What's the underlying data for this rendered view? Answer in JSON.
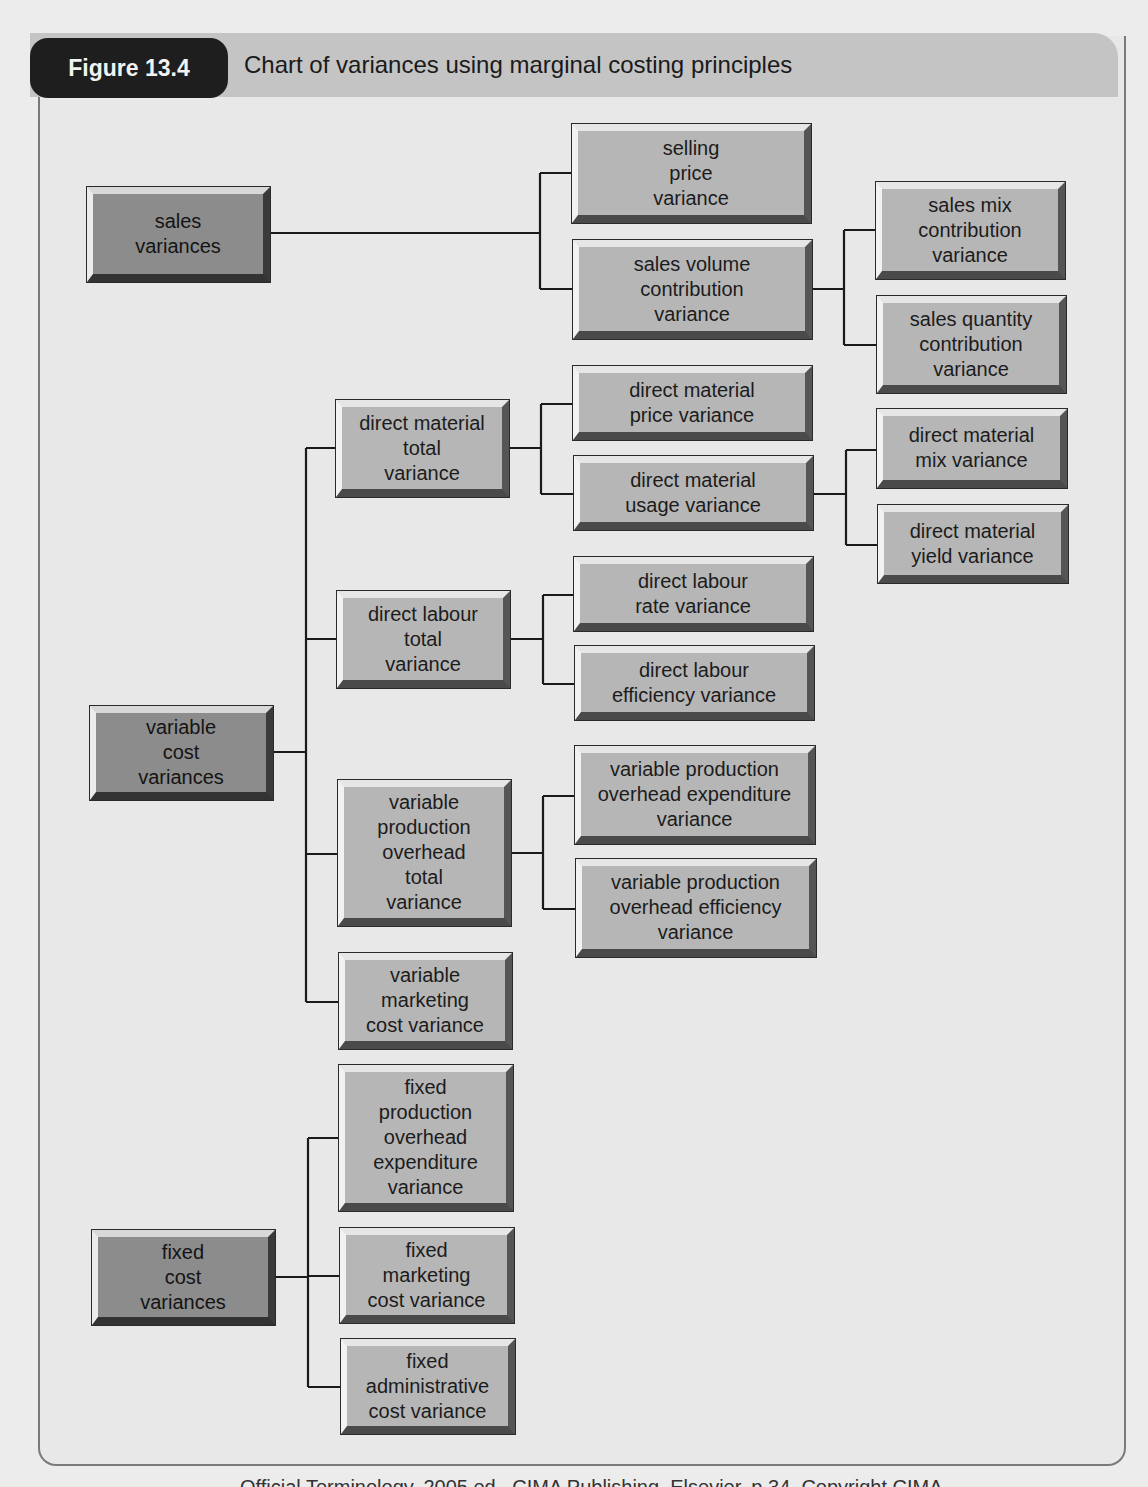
{
  "figure": {
    "tag": "Figure 13.4",
    "title": "Chart of variances using marginal costing principles",
    "footer_partial": "Official Terminology, 2005 ed., CIMA Publishing, Elsevier, p.34. Copyright CIMA"
  },
  "colors": {
    "root_box": "#8c8c8c",
    "child_box": "#b6b6b6",
    "frame_bg": "#e8e8e8",
    "title_bar": "#c4c4c4",
    "tag_bg": "#1e1e1e",
    "connector": "#1a1a1a"
  },
  "nodes": {
    "sales_variances": "sales\nvariances",
    "selling_price_variance": "selling\nprice\nvariance",
    "sales_volume_contribution_variance": "sales volume\ncontribution\nvariance",
    "sales_mix_contribution_variance": "sales mix\ncontribution\nvariance",
    "sales_quantity_contribution_variance": "sales quantity\ncontribution\nvariance",
    "variable_cost_variances": "variable\ncost\nvariances",
    "direct_material_total_variance": "direct material\ntotal\nvariance",
    "direct_material_price_variance": "direct material\nprice variance",
    "direct_material_usage_variance": "direct material\nusage variance",
    "direct_material_mix_variance": "direct material\nmix variance",
    "direct_material_yield_variance": "direct material\nyield variance",
    "direct_labour_total_variance": "direct labour\ntotal\nvariance",
    "direct_labour_rate_variance": "direct labour\nrate variance",
    "direct_labour_efficiency_variance": "direct labour\nefficiency variance",
    "variable_production_overhead_total_variance": "variable\nproduction\noverhead\ntotal\nvariance",
    "variable_production_overhead_expenditure_variance": "variable production\noverhead expenditure\nvariance",
    "variable_production_overhead_efficiency_variance": "variable production\noverhead efficiency\nvariance",
    "variable_marketing_cost_variance": "variable\nmarketing\ncost variance",
    "fixed_cost_variances": "fixed\ncost\nvariances",
    "fixed_production_overhead_expenditure_variance": "fixed\nproduction\noverhead\nexpenditure\nvariance",
    "fixed_marketing_cost_variance": "fixed\nmarketing\ncost variance",
    "fixed_administrative_cost_variance": "fixed\nadministrative\ncost variance"
  },
  "tree": [
    {
      "node": "sales_variances",
      "children": [
        {
          "node": "selling_price_variance"
        },
        {
          "node": "sales_volume_contribution_variance",
          "children": [
            {
              "node": "sales_mix_contribution_variance"
            },
            {
              "node": "sales_quantity_contribution_variance"
            }
          ]
        }
      ]
    },
    {
      "node": "variable_cost_variances",
      "children": [
        {
          "node": "direct_material_total_variance",
          "children": [
            {
              "node": "direct_material_price_variance"
            },
            {
              "node": "direct_material_usage_variance",
              "children": [
                {
                  "node": "direct_material_mix_variance"
                },
                {
                  "node": "direct_material_yield_variance"
                }
              ]
            }
          ]
        },
        {
          "node": "direct_labour_total_variance",
          "children": [
            {
              "node": "direct_labour_rate_variance"
            },
            {
              "node": "direct_labour_efficiency_variance"
            }
          ]
        },
        {
          "node": "variable_production_overhead_total_variance",
          "children": [
            {
              "node": "variable_production_overhead_expenditure_variance"
            },
            {
              "node": "variable_production_overhead_efficiency_variance"
            }
          ]
        },
        {
          "node": "variable_marketing_cost_variance"
        }
      ]
    },
    {
      "node": "fixed_cost_variances",
      "children": [
        {
          "node": "fixed_production_overhead_expenditure_variance"
        },
        {
          "node": "fixed_marketing_cost_variance"
        },
        {
          "node": "fixed_administrative_cost_variance"
        }
      ]
    }
  ]
}
